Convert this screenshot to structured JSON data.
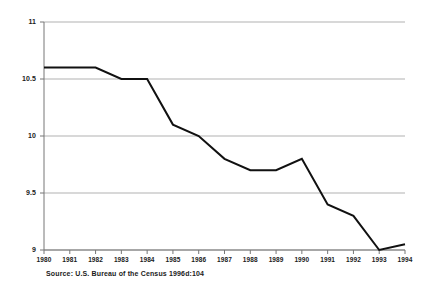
{
  "chart_data": {
    "type": "line",
    "title": "",
    "subtitle": "",
    "xlabel": "",
    "ylabel": "",
    "categories": [
      "1980",
      "1981",
      "1982",
      "1983",
      "1984",
      "1985",
      "1986",
      "1987",
      "1988",
      "1989",
      "1990",
      "1991",
      "1992",
      "1993",
      "1994"
    ],
    "x": [
      1980,
      1981,
      1982,
      1983,
      1984,
      1985,
      1986,
      1987,
      1988,
      1989,
      1990,
      1991,
      1992,
      1993,
      1994
    ],
    "values": [
      10.6,
      10.6,
      10.6,
      10.5,
      10.5,
      10.1,
      10.0,
      9.8,
      9.7,
      9.7,
      9.8,
      9.4,
      9.3,
      9.0,
      9.05
    ],
    "series": [
      {
        "name": "rate",
        "values": [
          10.6,
          10.6,
          10.6,
          10.5,
          10.5,
          10.1,
          10.0,
          9.8,
          9.7,
          9.7,
          9.8,
          9.4,
          9.3,
          9.0,
          9.05
        ],
        "color": "#111111"
      }
    ],
    "ylim": [
      9,
      11
    ],
    "xlim": [
      1980,
      1994
    ],
    "yticks": [
      9,
      9.5,
      10,
      10.5,
      11
    ],
    "ytick_labels": [
      "9",
      "9.5",
      "10",
      "10.5",
      "11"
    ],
    "xticks": [
      1980,
      1981,
      1982,
      1983,
      1984,
      1985,
      1986,
      1987,
      1988,
      1989,
      1990,
      1991,
      1992,
      1993,
      1994
    ],
    "xtick_labels": [
      "1980",
      "1981",
      "1982",
      "1983",
      "1984",
      "1985",
      "1986",
      "1987",
      "1988",
      "1989",
      "1990",
      "1991",
      "1992",
      "1993",
      "1994"
    ],
    "grid": "horizontal",
    "grid_color": "#a8a8a8",
    "axis_color": "#777777",
    "legend": null,
    "legend_position": "none",
    "annotations": []
  },
  "figure": {
    "source_note": "Source: U.S. Bureau of the Census 1996d:104",
    "background_color": "#ffffff",
    "line_color": "#111111"
  }
}
